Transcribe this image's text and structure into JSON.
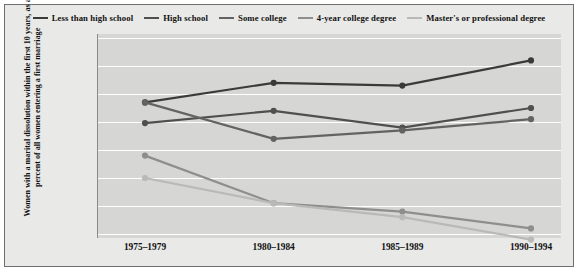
{
  "chart_data": {
    "type": "line",
    "title": "",
    "xlabel": "",
    "ylabel": "Women with a marital dissolution within the first 10 years, as a percent of all women entering a first marriage",
    "categories": [
      "1975–1979",
      "1980–1984",
      "1985–1989",
      "1990–1994"
    ],
    "ylim": [
      15,
      50
    ],
    "yticks": [
      "50%",
      "45%",
      "40%",
      "35%",
      "30%",
      "25%",
      "20%",
      "15%"
    ],
    "ytick_values": [
      50,
      45,
      40,
      35,
      30,
      25,
      20,
      15
    ],
    "grid": "horizontal",
    "legend_position": "top",
    "series": [
      {
        "name": "Less than high school",
        "color": "#3a3a3a",
        "values": [
          38.5,
          42.0,
          41.5,
          46.0
        ]
      },
      {
        "name": "High school",
        "color": "#4f4f4f",
        "values": [
          34.8,
          37.0,
          34.0,
          37.5
        ]
      },
      {
        "name": "Some college",
        "color": "#636363",
        "values": [
          38.5,
          32.0,
          33.5,
          35.5
        ]
      },
      {
        "name": "4-year college degree",
        "color": "#8e8e8e",
        "values": [
          29.0,
          20.5,
          19.0,
          16.0
        ]
      },
      {
        "name": "Master's or professional degree",
        "color": "#b9b9b9",
        "values": [
          25.0,
          20.5,
          18.0,
          14.0
        ]
      }
    ]
  }
}
